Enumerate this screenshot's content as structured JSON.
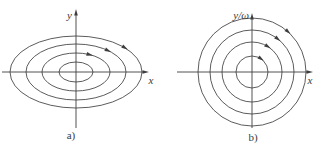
{
  "figure": {
    "ink_color": "#3e3e3e",
    "background_color": "#ffffff",
    "panels": [
      {
        "id": "a",
        "caption": "a)",
        "x_axis_label": "x",
        "y_axis_label": "y",
        "trajectory_shape": "ellipse",
        "direction": "clockwise",
        "center": {
          "x": 76,
          "y": 72
        },
        "rings": [
          {
            "rx": 17,
            "ry": 10
          },
          {
            "rx": 34,
            "ry": 19
          },
          {
            "rx": 50,
            "ry": 28
          },
          {
            "rx": 66,
            "ry": 36
          }
        ],
        "arrows": [
          {
            "ring": 1,
            "angle_deg": 66
          },
          {
            "ring": 2,
            "angle_deg": 50
          },
          {
            "ring": 3,
            "angle_deg": 42
          }
        ],
        "x_axis": {
          "x1": 2,
          "x2": 149,
          "y": 72
        },
        "y_axis": {
          "y1": 128,
          "y2": 9,
          "x": 76
        }
      },
      {
        "id": "b",
        "caption": "b)",
        "x_axis_label": "x",
        "y_axis_label": "y/ω",
        "trajectory_shape": "circle",
        "direction": "clockwise",
        "center": {
          "x": 252,
          "y": 72
        },
        "rings": [
          {
            "rx": 16,
            "ry": 16
          },
          {
            "rx": 30,
            "ry": 30
          },
          {
            "rx": 42,
            "ry": 42
          },
          {
            "rx": 54,
            "ry": 54
          }
        ],
        "arrows": [
          {
            "ring": 0,
            "angle_deg": 55
          },
          {
            "ring": 1,
            "angle_deg": 58
          },
          {
            "ring": 2,
            "angle_deg": 52
          },
          {
            "ring": 3,
            "angle_deg": 48
          }
        ],
        "x_axis": {
          "x1": 177,
          "x2": 313,
          "y": 72
        },
        "y_axis": {
          "y1": 128,
          "y2": 13,
          "x": 252
        }
      }
    ]
  }
}
